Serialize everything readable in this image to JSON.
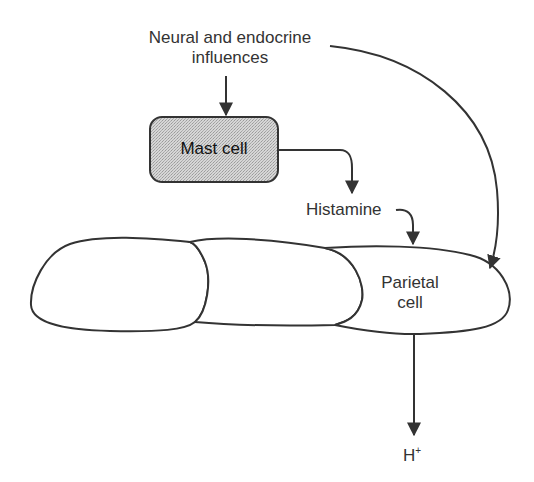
{
  "diagram": {
    "source_label_line1": "Neural and endocrine",
    "source_label_line2": "influences",
    "mast_cell_label": "Mast cell",
    "histamine_label": "Histamine",
    "parietal_cell_line1": "Parietal",
    "parietal_cell_line2": "cell",
    "output_label": "H",
    "output_superscript": "+"
  },
  "colors": {
    "stroke": "#333333",
    "mast_cell_fill": "#cfcfcf",
    "background": "#ffffff"
  }
}
